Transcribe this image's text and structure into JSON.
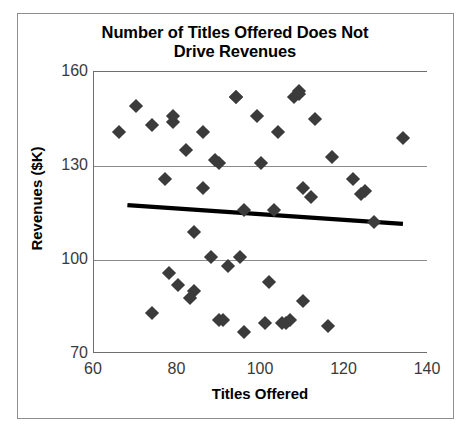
{
  "chart_data": {
    "type": "scatter",
    "title": "Number of Titles Offered Does Not Drive Revenues",
    "title_line1": "Number of Titles Offered Does Not",
    "title_line2": "Drive Revenues",
    "xlabel": "Titles Offered",
    "ylabel": "Revenues ($K)",
    "xlim": [
      60,
      140
    ],
    "ylim": [
      70,
      160
    ],
    "xticks": [
      60,
      80,
      100,
      120,
      140
    ],
    "yticks": [
      70,
      100,
      130,
      160
    ],
    "grid": "horizontal",
    "legend": "none",
    "marker_shape": "diamond",
    "marker_color": "#3b3b3b",
    "gridline_color": "#8a8a8a",
    "axis_color": "#6f6f6f",
    "trendline_color": "#000000",
    "points": [
      [
        66,
        141
      ],
      [
        70,
        149
      ],
      [
        74,
        143
      ],
      [
        74,
        83
      ],
      [
        77,
        126
      ],
      [
        78,
        96
      ],
      [
        79,
        144
      ],
      [
        79,
        146
      ],
      [
        80,
        92
      ],
      [
        82,
        135
      ],
      [
        83,
        88
      ],
      [
        84,
        90
      ],
      [
        84,
        109
      ],
      [
        86,
        141
      ],
      [
        86,
        123
      ],
      [
        88,
        101
      ],
      [
        89,
        132
      ],
      [
        90,
        131
      ],
      [
        90,
        81
      ],
      [
        91,
        81
      ],
      [
        92,
        98
      ],
      [
        94,
        152
      ],
      [
        94,
        152
      ],
      [
        95,
        101
      ],
      [
        96,
        116
      ],
      [
        96,
        77
      ],
      [
        99,
        146
      ],
      [
        100,
        131
      ],
      [
        101,
        80
      ],
      [
        102,
        93
      ],
      [
        103,
        116
      ],
      [
        104,
        141
      ],
      [
        105,
        80
      ],
      [
        106,
        80
      ],
      [
        107,
        81
      ],
      [
        108,
        152
      ],
      [
        109,
        154
      ],
      [
        109,
        153
      ],
      [
        110,
        123
      ],
      [
        110,
        87
      ],
      [
        112,
        120
      ],
      [
        113,
        145
      ],
      [
        116,
        79
      ],
      [
        117,
        133
      ],
      [
        122,
        126
      ],
      [
        124,
        121
      ],
      [
        125,
        122
      ],
      [
        127,
        112
      ],
      [
        134,
        139
      ]
    ],
    "trendline": {
      "x_start": 68,
      "y_start": 117.5,
      "x_end": 134,
      "y_end": 111.5
    }
  }
}
